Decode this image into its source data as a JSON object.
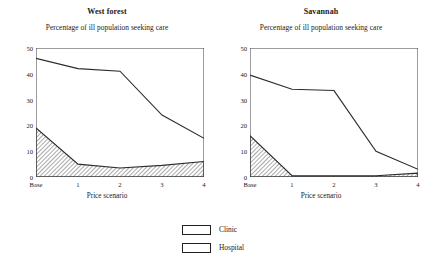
{
  "figure": {
    "subtitle": "Percentage of ill population seeking care",
    "xlabel": "Price scenario"
  },
  "legend": {
    "items": [
      {
        "label": "Clinic",
        "swatch": "clinic-open-swatch"
      },
      {
        "label": "Hospital",
        "swatch": "hospital-hatched-swatch"
      }
    ]
  },
  "chart_data": [
    {
      "type": "area",
      "title": "West forest",
      "subtitle": "Percentage of ill population seeking care",
      "xlabel": "Price scenario",
      "ylabel": "",
      "categories": [
        "Base",
        "1",
        "2",
        "3",
        "4"
      ],
      "x": [
        0,
        1,
        2,
        3,
        4
      ],
      "ylim": [
        0,
        50
      ],
      "yticks": [
        0,
        10,
        20,
        30,
        40,
        50
      ],
      "grid": false,
      "stacked": true,
      "legend_position": "bottom-center",
      "series": [
        {
          "name": "Hospital",
          "values": [
            19,
            5,
            3.5,
            4.5,
            6
          ],
          "fill": "diagonal-hatch"
        },
        {
          "name": "Clinic",
          "values": [
            46,
            42,
            41,
            24,
            15
          ],
          "fill": "none",
          "note": "cumulative top boundary"
        }
      ]
    },
    {
      "type": "area",
      "title": "Savannah",
      "subtitle": "Percentage of ill population seeking care",
      "xlabel": "Price scenario",
      "ylabel": "",
      "categories": [
        "Base",
        "1",
        "2",
        "3",
        "4"
      ],
      "x": [
        0,
        1,
        2,
        3,
        4
      ],
      "ylim": [
        0,
        50
      ],
      "yticks": [
        0,
        10,
        20,
        30,
        40,
        50
      ],
      "grid": false,
      "stacked": true,
      "legend_position": "bottom-center",
      "series": [
        {
          "name": "Hospital",
          "values": [
            16,
            0.5,
            0.5,
            0.5,
            1.5
          ],
          "fill": "diagonal-hatch"
        },
        {
          "name": "Clinic",
          "values": [
            39.5,
            34,
            33.5,
            10,
            3
          ],
          "fill": "none",
          "note": "cumulative top boundary"
        }
      ]
    }
  ],
  "colors": {
    "line": "#2b2b2b",
    "frame": "#3a3a3a",
    "hatch": "#555555",
    "background": "#ffffff"
  }
}
